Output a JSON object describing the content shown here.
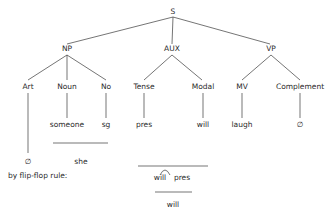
{
  "tree": {
    "root": "S",
    "level1": [
      "NP",
      "AUX",
      "VP"
    ],
    "level2": {
      "NP": [
        "Art",
        "Noun",
        "No"
      ],
      "AUX": [
        "Tense",
        "Modal"
      ],
      "VP": [
        "MV",
        "Complement"
      ]
    },
    "terminals": {
      "Noun": "someone",
      "No": "sg",
      "Tense": "pres",
      "Modal": "will",
      "MV": "laugh",
      "Complement": "∅"
    }
  },
  "derivations": {
    "art_result": "∅",
    "pronoun_result": "she",
    "flip_flop_label": "by flip-flop rule:",
    "flip_flop_left": "will",
    "flip_flop_right": "pres",
    "flip_flop_result": "will"
  },
  "colors": {
    "line": "#3a3a3a",
    "text": "#2a2a2a",
    "background": "#ffffff"
  }
}
